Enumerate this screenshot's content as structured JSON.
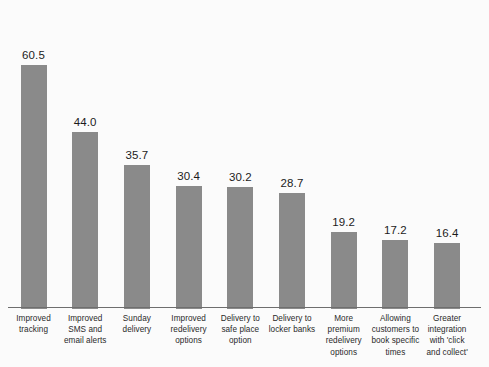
{
  "chart_data": {
    "type": "bar",
    "title": "",
    "subtitle": "",
    "xlabel": "",
    "ylabel": "",
    "ylim": [
      0,
      66
    ],
    "grid": false,
    "legend": "none",
    "axis": {
      "baseline_visible": true,
      "y_axis_visible": false,
      "tick_labels": []
    },
    "bar_color": "#8a8a8a",
    "background_color": "#fbfbfb",
    "categories": [
      "Improved tracking",
      "Improved SMS and email alerts",
      "Sunday delivery",
      "Improved redelivery options",
      "Delivery to safe place option",
      "Delivery to locker banks",
      "More premium redelivery options",
      "Allowing customers to book specific times",
      "Greater integration with 'click and collect'"
    ],
    "values": [
      60.5,
      44.0,
      35.7,
      30.4,
      30.2,
      28.7,
      19.2,
      17.2,
      16.4
    ],
    "value_labels": [
      "60.5",
      "44.0",
      "35.7",
      "30.4",
      "30.2",
      "28.7",
      "19.2",
      "17.2",
      "16.4"
    ],
    "bars": [
      {
        "label_lines": [
          "Improved",
          "tracking"
        ],
        "value": 60.5,
        "value_label": "60.5"
      },
      {
        "label_lines": [
          "Improved",
          "SMS and",
          "email alerts"
        ],
        "value": 44.0,
        "value_label": "44.0"
      },
      {
        "label_lines": [
          "Sunday",
          "delivery"
        ],
        "value": 35.7,
        "value_label": "35.7"
      },
      {
        "label_lines": [
          "Improved",
          "redelivery",
          "options"
        ],
        "value": 30.4,
        "value_label": "30.4"
      },
      {
        "label_lines": [
          "Delivery to",
          "safe place",
          "option"
        ],
        "value": 30.2,
        "value_label": "30.2"
      },
      {
        "label_lines": [
          "Delivery to",
          "locker banks"
        ],
        "value": 28.7,
        "value_label": "28.7"
      },
      {
        "label_lines": [
          "More",
          "premium",
          "redelivery",
          "options"
        ],
        "value": 19.2,
        "value_label": "19.2"
      },
      {
        "label_lines": [
          "Allowing",
          "customers to",
          "book specific",
          "times"
        ],
        "value": 17.2,
        "value_label": "17.2"
      },
      {
        "label_lines": [
          "Greater",
          "integration",
          "with 'click",
          "and collect'"
        ],
        "value": 16.4,
        "value_label": "16.4"
      }
    ]
  }
}
